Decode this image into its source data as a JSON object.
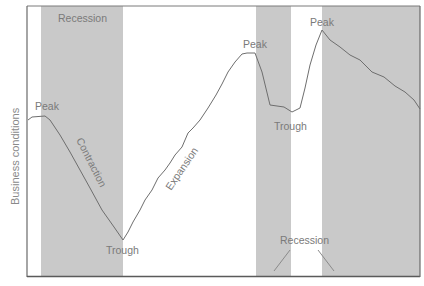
{
  "chart_data": {
    "type": "line",
    "title": "",
    "xlabel": "",
    "ylabel": "Business conditions",
    "grid": false,
    "legend": null,
    "shaded_regions": [
      {
        "label": "Recession",
        "x_start": 41,
        "x_end": 123
      },
      {
        "label": "Recession",
        "x_start": 256,
        "x_end": 291
      },
      {
        "label": "Recession",
        "x_start": 322,
        "x_end": 420
      }
    ],
    "series": [
      {
        "name": "Business conditions",
        "points": [
          [
            28,
            120
          ],
          [
            32,
            117
          ],
          [
            45,
            116
          ],
          [
            50,
            120
          ],
          [
            60,
            135
          ],
          [
            70,
            152
          ],
          [
            80,
            170
          ],
          [
            90,
            188
          ],
          [
            102,
            210
          ],
          [
            114,
            227
          ],
          [
            123,
            240
          ],
          [
            128,
            232
          ],
          [
            133,
            222
          ],
          [
            140,
            210
          ],
          [
            145,
            200
          ],
          [
            152,
            190
          ],
          [
            158,
            178
          ],
          [
            165,
            170
          ],
          [
            170,
            163
          ],
          [
            175,
            155
          ],
          [
            182,
            147
          ],
          [
            188,
            133
          ],
          [
            193,
            128
          ],
          [
            200,
            120
          ],
          [
            208,
            108
          ],
          [
            216,
            95
          ],
          [
            222,
            84
          ],
          [
            228,
            72
          ],
          [
            235,
            62
          ],
          [
            242,
            54
          ],
          [
            247,
            53
          ],
          [
            255,
            53
          ],
          [
            262,
            72
          ],
          [
            270,
            105
          ],
          [
            277,
            106
          ],
          [
            284,
            107
          ],
          [
            292,
            112
          ],
          [
            300,
            108
          ],
          [
            305,
            88
          ],
          [
            310,
            65
          ],
          [
            316,
            45
          ],
          [
            322,
            30
          ],
          [
            330,
            40
          ],
          [
            340,
            47
          ],
          [
            350,
            55
          ],
          [
            360,
            60
          ],
          [
            372,
            72
          ],
          [
            384,
            77
          ],
          [
            395,
            86
          ],
          [
            405,
            92
          ],
          [
            414,
            100
          ],
          [
            420,
            109
          ]
        ]
      }
    ],
    "annotations": [
      {
        "text": "Recession",
        "x": 82,
        "y": 22
      },
      {
        "text": "Peak",
        "x": 46,
        "y": 110
      },
      {
        "text": "Contraction",
        "x": 90,
        "y": 150,
        "rotation": 62
      },
      {
        "text": "Trough",
        "x": 123,
        "y": 254
      },
      {
        "text": "Expansion",
        "x": 180,
        "y": 165,
        "rotation": -55
      },
      {
        "text": "Peak",
        "x": 255,
        "y": 47
      },
      {
        "text": "Trough",
        "x": 290,
        "y": 129
      },
      {
        "text": "Peak",
        "x": 321,
        "y": 25
      },
      {
        "text": "Recession",
        "x": 303,
        "y": 241
      }
    ]
  },
  "labels": {
    "y_axis": "Business conditions",
    "recession_top": "Recession",
    "recession_bottom": "Recession",
    "peak_1": "Peak",
    "peak_2": "Peak",
    "peak_3": "Peak",
    "trough_1": "Trough",
    "trough_2": "Trough",
    "contraction": "Contraction",
    "expansion": "Expansion"
  },
  "colors": {
    "shade": "#c9c9c9",
    "line": "#6e6e6e",
    "frame": "#6a6a6a",
    "text": "#7a7a7a"
  }
}
